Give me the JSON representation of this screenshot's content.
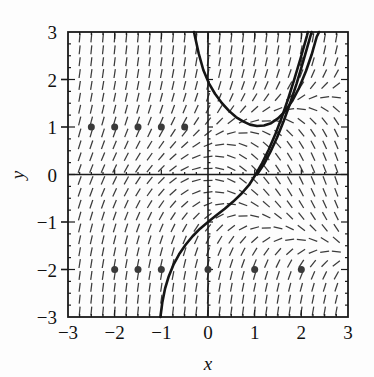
{
  "figure": {
    "type": "slope-field-plot",
    "xlabel": "x",
    "ylabel": "y",
    "frame_color": "#1a1a1a",
    "field_color": "#3b3b3b",
    "curve_color": "#151515",
    "point_color": "#3a3a3a"
  },
  "chart_data": {
    "type": "scatter",
    "title": "",
    "xlabel": "x",
    "ylabel": "y",
    "xlim": [
      -3,
      3
    ],
    "ylim": [
      -3,
      3
    ],
    "xticks": [
      -3,
      -2,
      -1,
      0,
      1,
      2,
      3
    ],
    "yticks": [
      -3,
      -2,
      -1,
      0,
      1,
      2,
      3
    ],
    "xtick_labels": [
      "-3",
      "-2",
      "-1",
      "0",
      "1",
      "2",
      "3"
    ],
    "ytick_labels": [
      "-3",
      "-2",
      "-1",
      "0",
      "1",
      "2",
      "3"
    ],
    "minor_tick_step": 0.25,
    "grid": false,
    "legend": "none",
    "slope_field": {
      "description": "direction field of dy/dx = y^2 - x drawn as short dashes",
      "equation": "dy/dx = y^2 - x",
      "x_start": -2.75,
      "x_end": 2.75,
      "x_step": 0.25,
      "y_start": -2.875,
      "y_end": 2.875,
      "y_step": 0.25,
      "dash_length": 9
    },
    "solution_curves": [
      {
        "name": "curve-upper-u",
        "description": "U-shaped solution entering top near x=-0.3, minimum near (1.05, 1.0), exiting top-right",
        "points": [
          [
            -0.3,
            3.0
          ],
          [
            -0.2,
            2.55
          ],
          [
            -0.1,
            2.2
          ],
          [
            0.02,
            1.92
          ],
          [
            0.15,
            1.7
          ],
          [
            0.3,
            1.5
          ],
          [
            0.45,
            1.34
          ],
          [
            0.6,
            1.21
          ],
          [
            0.75,
            1.12
          ],
          [
            0.9,
            1.05
          ],
          [
            1.05,
            1.02
          ],
          [
            1.2,
            1.03
          ],
          [
            1.35,
            1.08
          ],
          [
            1.5,
            1.18
          ],
          [
            1.65,
            1.33
          ],
          [
            1.8,
            1.54
          ],
          [
            1.95,
            1.82
          ],
          [
            2.1,
            2.18
          ],
          [
            2.22,
            2.52
          ],
          [
            2.33,
            2.9
          ],
          [
            2.38,
            3.0
          ]
        ]
      },
      {
        "name": "curve-through-origin-region",
        "description": "Solution rising from lower left, through (0,-1) and (1,0), asymptotic upward near x=2.4",
        "points": [
          [
            -1.02,
            -3.0
          ],
          [
            -0.98,
            -2.7
          ],
          [
            -0.92,
            -2.4
          ],
          [
            -0.84,
            -2.14
          ],
          [
            -0.74,
            -1.9
          ],
          [
            -0.62,
            -1.68
          ],
          [
            -0.48,
            -1.48
          ],
          [
            -0.33,
            -1.3
          ],
          [
            -0.17,
            -1.14
          ],
          [
            0.0,
            -1.0
          ],
          [
            0.18,
            -0.86
          ],
          [
            0.36,
            -0.72
          ],
          [
            0.54,
            -0.57
          ],
          [
            0.72,
            -0.4
          ],
          [
            0.88,
            -0.22
          ],
          [
            1.02,
            0.0
          ],
          [
            1.16,
            0.24
          ],
          [
            1.3,
            0.52
          ],
          [
            1.44,
            0.84
          ],
          [
            1.58,
            1.2
          ],
          [
            1.72,
            1.6
          ],
          [
            1.86,
            2.04
          ],
          [
            2.0,
            2.5
          ],
          [
            2.12,
            2.92
          ],
          [
            2.14,
            3.0
          ]
        ]
      },
      {
        "name": "curve-right-companion",
        "description": "Second branch hugging the right side, slightly offset to the right of the previous curve above y=0",
        "points": [
          [
            1.05,
            0.0
          ],
          [
            1.2,
            0.22
          ],
          [
            1.34,
            0.48
          ],
          [
            1.48,
            0.78
          ],
          [
            1.62,
            1.12
          ],
          [
            1.76,
            1.5
          ],
          [
            1.9,
            1.92
          ],
          [
            2.04,
            2.38
          ],
          [
            2.18,
            2.86
          ],
          [
            2.22,
            3.0
          ]
        ]
      }
    ],
    "points_series": [
      {
        "name": "dots-y-1",
        "y": 1,
        "x": [
          -2.5,
          -2.0,
          -1.5,
          -1.0,
          -0.5
        ],
        "marker": "filled-circle",
        "marker_size": 7
      },
      {
        "name": "dots-y-minus-2",
        "y": -2,
        "x": [
          -2.0,
          -1.5,
          -1.0,
          0.0,
          1.0,
          2.0
        ],
        "marker": "filled-circle",
        "marker_size": 7
      }
    ]
  }
}
